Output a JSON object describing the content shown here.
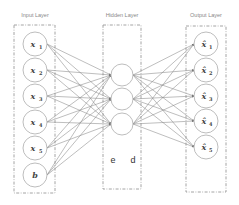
{
  "diagram": {
    "layers": {
      "input": {
        "title": "Input Layer",
        "nodes": [
          {
            "base": "x",
            "sub": "1"
          },
          {
            "base": "x",
            "sub": "2"
          },
          {
            "base": "x",
            "sub": "3"
          },
          {
            "base": "x",
            "sub": "4"
          },
          {
            "base": "x",
            "sub": "5"
          },
          {
            "base": "b",
            "sub": ""
          }
        ]
      },
      "hidden": {
        "title": "Hidden Layer",
        "nodes": 3,
        "labels": [
          "e",
          "d"
        ]
      },
      "output": {
        "title": "Output Layer",
        "nodes": [
          {
            "base": "x̂",
            "sub": "1"
          },
          {
            "base": "x̂",
            "sub": "2"
          },
          {
            "base": "x̂",
            "sub": "3"
          },
          {
            "base": "x̂",
            "sub": "4"
          },
          {
            "base": "x̂",
            "sub": "5"
          }
        ]
      }
    },
    "colors": {
      "edge": "#888888",
      "node_stroke": "#b5b5b5",
      "box_stroke": "#9a9a9a",
      "text": "#444444"
    }
  }
}
